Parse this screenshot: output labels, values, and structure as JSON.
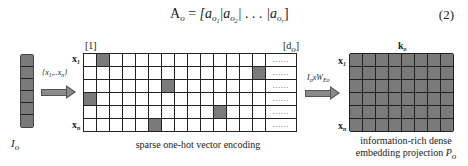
{
  "equation": {
    "lhs": "A",
    "lhs_sub": "o",
    "equals": "=",
    "open": "[a",
    "t1_sub": "o",
    "t1_ssub": "1",
    "sep1": "|a",
    "t2_sub": "o",
    "t2_ssub": "2",
    "sep2": "| . . . |a",
    "t3_sub": "o",
    "t3_ssub": "r",
    "close": "]",
    "number": "(2)"
  },
  "figure": {
    "input_column": {
      "label": "I",
      "label_sub": "o",
      "cells": 6,
      "fill_color": "#7a7a7a"
    },
    "arrow1": {
      "label": "{x",
      "label_sub1": "1",
      "label_mid": ",..x",
      "label_sub2": "n",
      "label_end": "}"
    },
    "sparse_grid": {
      "col_start_label": "[1]",
      "col_end_label": "[d",
      "col_end_sub": "o",
      "col_end_close": "]",
      "row_top_label": "x",
      "row_top_sub": "1",
      "row_bottom_label": "x",
      "row_bottom_sub": "n",
      "rows": 6,
      "cols": 14,
      "overflow_text": "......",
      "filled_cells": [
        [
          0,
          1
        ],
        [
          1,
          13
        ],
        [
          2,
          6
        ],
        [
          3,
          0
        ],
        [
          4,
          10
        ],
        [
          5,
          5
        ]
      ],
      "caption": "sparse one-hot vector encoding"
    },
    "arrow2": {
      "label": "I",
      "label_sub1": "o",
      "label_mid": "xW",
      "label_sub2": "Eo"
    },
    "dense_grid": {
      "col_label": "k",
      "col_label_sub": "o",
      "row_top_label": "x",
      "row_top_sub": "1",
      "row_bottom_label": "x",
      "row_bottom_sub": "n",
      "rows": 6,
      "cols": 8,
      "fill_color": "#7a7a7a",
      "caption_line1": "information-rich dense",
      "caption_line2": "embedding projection ",
      "caption_var": "P",
      "caption_var_sub": "o"
    }
  }
}
